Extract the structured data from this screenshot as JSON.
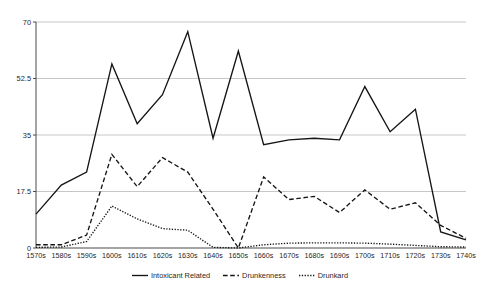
{
  "chart_data": {
    "type": "line",
    "title": "",
    "subtitle": "",
    "xlabel": "",
    "ylabel": "",
    "categories": [
      "1570s",
      "1580s",
      "1590s",
      "1600s",
      "1610s",
      "1620s",
      "1630s",
      "1640s",
      "1650s",
      "1660s",
      "1670s",
      "1680s",
      "1690s",
      "1700s",
      "1710s",
      "1720s",
      "1730s",
      "1740s"
    ],
    "ylim": [
      0,
      70
    ],
    "yticks": [
      0,
      17.5,
      35,
      52.5,
      70
    ],
    "ytick_labels": [
      "0",
      "17.5",
      "35",
      "52.5",
      "70"
    ],
    "grid": true,
    "legend_position": "bottom-center",
    "series": [
      {
        "name": "Intoxicant Related",
        "style": "solid",
        "color": "#151515",
        "values": [
          10.5,
          19.5,
          23.5,
          57.0,
          38.5,
          47.5,
          67.0,
          34.0,
          61.0,
          32.0,
          33.5,
          34.0,
          33.5,
          50.0,
          36.0,
          43.0,
          5.0,
          2.5
        ]
      },
      {
        "name": "Drunkenness",
        "style": "dashed",
        "color": "#151515",
        "values": [
          1.0,
          1.0,
          4.0,
          29.0,
          19.0,
          28.0,
          23.5,
          12.0,
          0.0,
          22.0,
          15.0,
          16.0,
          11.0,
          18.0,
          12.0,
          14.0,
          7.0,
          3.0
        ]
      },
      {
        "name": "Drunkard",
        "style": "dotted",
        "color": "#151515",
        "values": [
          0.2,
          0.3,
          2.0,
          13.0,
          9.0,
          6.0,
          5.5,
          0.2,
          0.0,
          1.0,
          1.5,
          1.6,
          1.6,
          1.5,
          1.2,
          0.8,
          0.4,
          0.3
        ]
      }
    ]
  },
  "legend": {
    "items": [
      {
        "label": "Intoxicant Related",
        "style": "solid"
      },
      {
        "label": "Drunkenness",
        "style": "dashed"
      },
      {
        "label": "Drunkard",
        "style": "dotted"
      }
    ]
  }
}
